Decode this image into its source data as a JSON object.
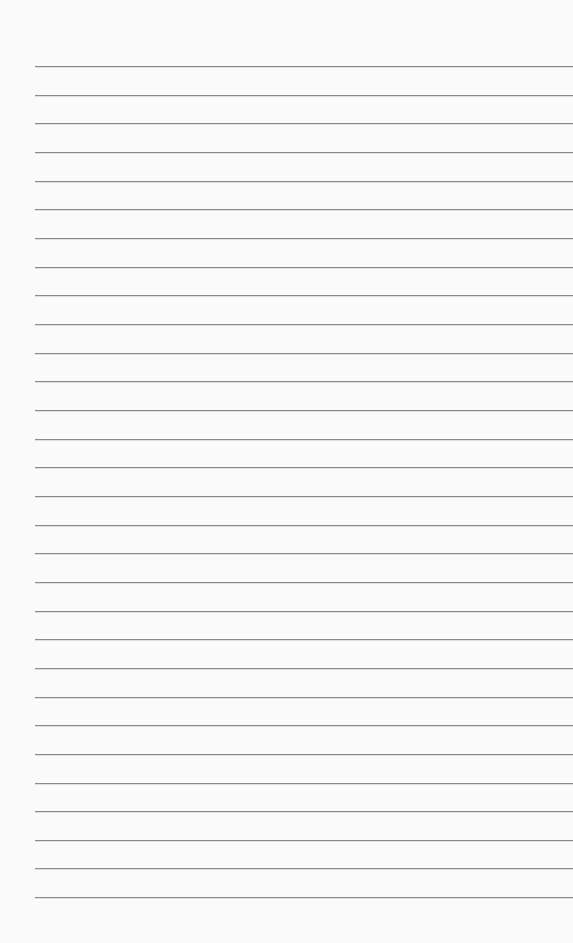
{
  "paper": {
    "type": "lined-paper",
    "background_color": "#fbfbfb",
    "rule_color": "#8a8a8a",
    "line_count": 30,
    "first_line_y": 66,
    "line_spacing": 28.66,
    "left_margin_x": 35
  }
}
